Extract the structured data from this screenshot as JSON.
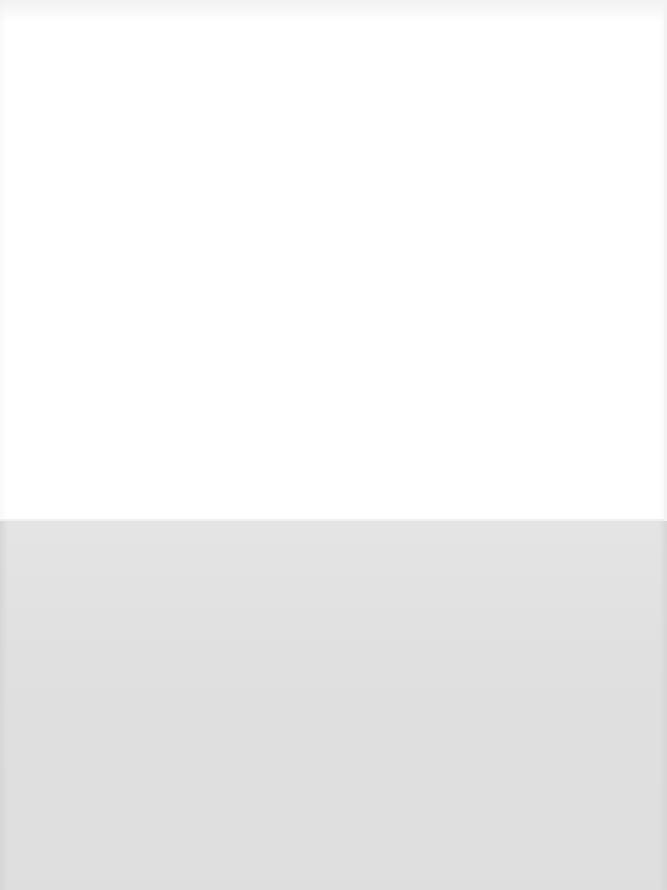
{
  "scene": {
    "description": "Blank white sheet over a light gray surface; no visible text",
    "colors": {
      "sheet": "#ffffff",
      "surface": "#e1e1e1"
    }
  }
}
